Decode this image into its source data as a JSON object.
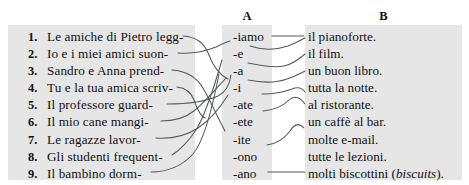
{
  "headers": {
    "column_a": "A",
    "column_b": "B"
  },
  "colors": {
    "band": "#e6e6e6",
    "text": "#111111",
    "connector": "#55585c",
    "page_background": "#ffffff"
  },
  "left_column": [
    {
      "number": "1.",
      "text": "Le amiche di Pietro legg-"
    },
    {
      "number": "2.",
      "text": "Io e i miei amici suon-"
    },
    {
      "number": "3.",
      "text": "Sandro e Anna prend-"
    },
    {
      "number": "4.",
      "text": "Tu e la tua amica scriv-"
    },
    {
      "number": "5.",
      "text": "Il professore guard-"
    },
    {
      "number": "6.",
      "text": "Il mio cane mangi-"
    },
    {
      "number": "7.",
      "text": "Le ragazze lavor-"
    },
    {
      "number": "8.",
      "text": "Gli studenti frequent-"
    },
    {
      "number": "9.",
      "text": "Il bambino dorm-"
    }
  ],
  "column_a": [
    {
      "text": "-iamo"
    },
    {
      "text": "-e"
    },
    {
      "text": "-a"
    },
    {
      "text": "-i"
    },
    {
      "text": "-ate"
    },
    {
      "text": "-ete"
    },
    {
      "text": "-ite"
    },
    {
      "text": "-ono"
    },
    {
      "text": "-ano"
    }
  ],
  "column_b": [
    {
      "text": "il pianoforte.",
      "italic": ""
    },
    {
      "text": "il film.",
      "italic": ""
    },
    {
      "text": "un buon libro.",
      "italic": ""
    },
    {
      "text": "tutta la notte.",
      "italic": ""
    },
    {
      "text": "al ristorante.",
      "italic": ""
    },
    {
      "text": "un caffè al bar.",
      "italic": ""
    },
    {
      "text": "molte e-mail.",
      "italic": ""
    },
    {
      "text": "tutte le lezioni.",
      "italic": ""
    },
    {
      "text": "molti biscottini (",
      "italic": "biscuits",
      "text_after": ")."
    }
  ],
  "connections": {
    "stem_to_a": [
      {
        "from": 1,
        "to": 8
      },
      {
        "from": 2,
        "to": 1
      },
      {
        "from": 3,
        "to": 8
      },
      {
        "from": 4,
        "to": 5
      },
      {
        "from": 5,
        "to": 3
      },
      {
        "from": 6,
        "to": 3
      },
      {
        "from": 7,
        "to": 4
      },
      {
        "from": 8,
        "to": 2
      },
      {
        "from": 9,
        "to": 2
      }
    ],
    "a_to_b": [
      {
        "from": 1,
        "to": 1
      },
      {
        "from": 2,
        "to": 2
      },
      {
        "from": 3,
        "to": 3
      },
      {
        "from": 4,
        "to": 4
      },
      {
        "from": 5,
        "to": 5
      },
      {
        "from": 6,
        "to": 6
      },
      {
        "from": 8,
        "to": 7
      },
      {
        "from": 9,
        "to": 9
      }
    ]
  }
}
